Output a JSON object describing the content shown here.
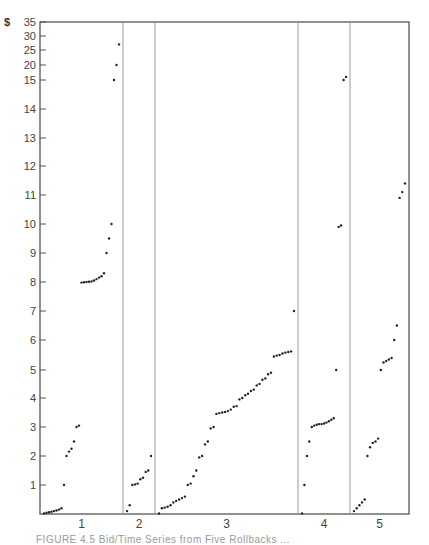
{
  "chart_data": {
    "type": "scatter",
    "title": "",
    "xlabel": "",
    "ylabel": "$",
    "y_currency_symbol": "$",
    "y_scale": "broken (linear 0-15 step 1, compressed 15-35 step 5)",
    "yticks": [
      1,
      2,
      3,
      4,
      5,
      6,
      7,
      8,
      9,
      10,
      11,
      12,
      13,
      14,
      15,
      20,
      25,
      30,
      35
    ],
    "ylim": [
      0,
      35
    ],
    "grid": false,
    "legend": null,
    "sections": [
      {
        "label": "1",
        "points": [
          0.02,
          0.04,
          0.06,
          0.08,
          0.1,
          0.12,
          0.15,
          0.2,
          1.0,
          2.0,
          2.15,
          2.25,
          2.5,
          3.0,
          3.05,
          7.98,
          7.99,
          8.0,
          8.01,
          8.02,
          8.05,
          8.1,
          8.15,
          8.2,
          8.3,
          9.0,
          9.5,
          10.0,
          15,
          20,
          27
        ]
      },
      {
        "label": "2",
        "points": [
          0.1,
          0.3,
          1.0,
          1.02,
          1.05,
          1.2,
          1.25,
          1.45,
          1.5,
          2.0
        ]
      },
      {
        "label": "3",
        "points": [
          0.02,
          0.2,
          0.22,
          0.25,
          0.3,
          0.4,
          0.45,
          0.5,
          0.55,
          0.6,
          1.0,
          1.05,
          1.3,
          1.5,
          1.95,
          2.0,
          2.4,
          2.5,
          2.95,
          3.0,
          3.45,
          3.48,
          3.5,
          3.52,
          3.55,
          3.6,
          3.7,
          3.72,
          3.95,
          4.0,
          4.1,
          4.15,
          4.25,
          4.3,
          4.45,
          4.5,
          4.65,
          4.7,
          4.85,
          4.9,
          5.45,
          5.48,
          5.5,
          5.55,
          5.58,
          5.6,
          5.62,
          7.0
        ]
      },
      {
        "label": "4",
        "points": [
          0.02,
          1.0,
          2.0,
          2.5,
          3.0,
          3.05,
          3.08,
          3.1,
          3.1,
          3.12,
          3.15,
          3.2,
          3.25,
          3.3,
          5.0,
          9.9,
          9.95,
          15,
          16
        ]
      },
      {
        "label": "5",
        "points": [
          0.1,
          0.2,
          0.3,
          0.4,
          0.5,
          2.0,
          2.3,
          2.45,
          2.5,
          2.6,
          5.0,
          5.25,
          5.3,
          5.35,
          5.4,
          6.0,
          6.5,
          10.9,
          11.1,
          11.4
        ]
      }
    ]
  },
  "caption": {
    "text": "FIGURE 4.5 Bid/Time Series from Five Rollbacks ..."
  }
}
